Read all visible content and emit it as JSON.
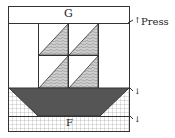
{
  "diagram": {
    "top_band_label": "G",
    "bottom_band_label": "F",
    "press_label": "Press",
    "arrow_glyph": "↑",
    "arrow_small": "↓"
  },
  "colors": {
    "outline": "#333333",
    "hull": "#555555",
    "pattern": "#9a9a9a",
    "background": "#ffffff"
  }
}
